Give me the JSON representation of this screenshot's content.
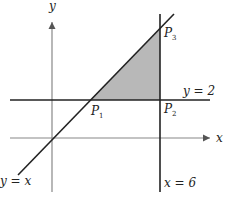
{
  "figure": {
    "axes": {
      "x_label": "x",
      "y_label": "y"
    },
    "lines": {
      "horizontal": "y = 2",
      "vertical": "x = 6",
      "diagonal": "y = x"
    },
    "points": {
      "p1": {
        "letter": "P",
        "sub": "1"
      },
      "p2": {
        "letter": "P",
        "sub": "2"
      },
      "p3": {
        "letter": "P",
        "sub": "3"
      }
    },
    "colors": {
      "shaded_region": "#b8b8b8",
      "lines": "#222222",
      "axes": "#888888"
    }
  }
}
